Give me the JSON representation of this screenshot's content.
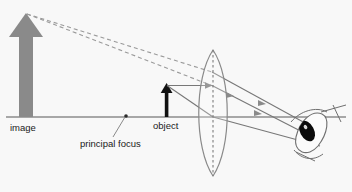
{
  "figure": {
    "title": "",
    "background_color": "#f8f8f8",
    "width": 352,
    "height": 192
  },
  "labels": {
    "image": "image",
    "object": "object",
    "principal_focus": "principal focus"
  },
  "colors": {
    "image_arrow": "#8a8a8a",
    "object_arrow": "#111111",
    "axis": "#8c8c8c",
    "ray_solid": "#777777",
    "ray_dashed": "#9a9a9a",
    "lens_outline": "#8a8a8a",
    "lens_axis_dashed": "#7d7d7d",
    "eye_outline": "#6f6f6f",
    "pupil": "#0b0b0b",
    "text": "#1a1a1a"
  },
  "optics": {
    "type": "ray-diagram",
    "element": "converging-lens",
    "axis_y": 117,
    "lens_center_x": 213,
    "lens_top_y": 50,
    "lens_bottom_y": 176,
    "object": {
      "base_x": 167,
      "base_y": 117,
      "tip_y": 85,
      "height_px": 32,
      "orientation": "upright"
    },
    "image": {
      "base_x": 26,
      "base_y": 117,
      "tip_y": 14,
      "height_px": 103,
      "orientation": "upright",
      "kind": "virtual-magnified"
    },
    "principal_focus": {
      "x": 126,
      "y": 116
    },
    "eye": {
      "center_x": 314,
      "center_y": 134
    }
  },
  "annotations": [
    {
      "name": "image-label",
      "text": "image",
      "x": 10,
      "y": 130
    },
    {
      "name": "object-label",
      "text": "object",
      "x": 153,
      "y": 129
    },
    {
      "name": "principal-focus-label",
      "text": "principal focus",
      "x": 80,
      "y": 146
    }
  ]
}
